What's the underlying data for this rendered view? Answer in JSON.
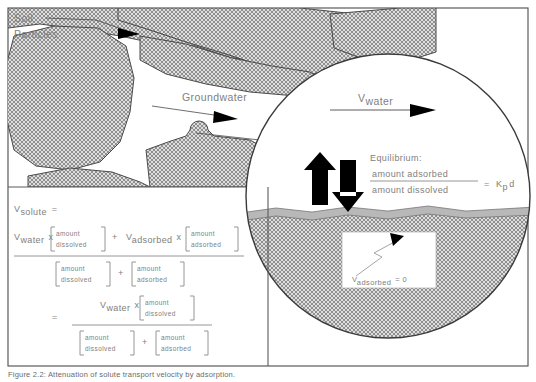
{
  "figure": {
    "caption": "Figure 2.2:  Attenuation of solute transport velocity by adsorption."
  },
  "labels": {
    "soil_particles_line1": "Soil",
    "soil_particles_line2": "Particles",
    "groundwater": "Groundwater",
    "v_water_main": "V",
    "v_water_sub": "water",
    "equilibrium_title": "Equilibrium:",
    "equilibrium_numerator": "amount  adsorbed",
    "equilibrium_denominator": "amount  dissolved",
    "equilibrium_equals": "=",
    "equilibrium_rhs_main": "K",
    "equilibrium_rhs_sub": "p",
    "equilibrium_rhs_tail": "d",
    "v_adsorbed_main": "V",
    "v_adsorbed_sub": "adsorbed",
    "v_adsorbed_value": "=  0"
  },
  "equation": {
    "lhs_main": "V",
    "lhs_sub": "solute",
    "equals": "=",
    "row1": {
      "v_water_main": "V",
      "v_water_sub": "water",
      "times1": "x",
      "bracket1_line1": "amount",
      "bracket1_line2": "dissolved",
      "plus1": "+",
      "v_adsorbed_main": "V",
      "v_adsorbed_sub": "adsorbed",
      "times2": "x",
      "bracket2_line1": "amount",
      "bracket2_line2": "adsorbed"
    },
    "row1_denominator": {
      "bracket1_line1": "amount",
      "bracket1_line2": "dissolved",
      "plus": "+",
      "bracket2_line1": "amount",
      "bracket2_line2": "adsorbed"
    },
    "row2": {
      "equals": "=",
      "v_water_main": "V",
      "v_water_sub": "water",
      "times": "x",
      "bracket_line1": "amount",
      "bracket_line2": "dissolved"
    },
    "row2_denominator": {
      "bracket1_line1": "amount",
      "bracket1_line2": "dissolved",
      "plus": "+",
      "bracket2_line1": "amount",
      "bracket2_line2": "adsorbed"
    }
  },
  "colors": {
    "ink": "#808080",
    "line": "#4a4a4a",
    "hatch": "#8c8c8c",
    "arrow_solid": "#000000",
    "surface_band": "#b8b8b8",
    "frame": "#5a5a5a"
  }
}
